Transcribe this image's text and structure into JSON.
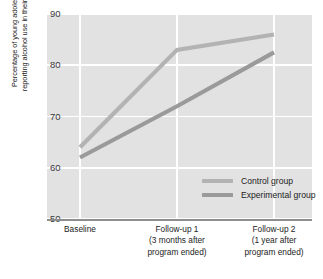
{
  "chart_data": {
    "type": "line",
    "title": "",
    "xlabel": "",
    "ylabel_lines": [
      "Percentage of young adolescents",
      "reporting alcohol use in their lifetime"
    ],
    "categories": [
      "Baseline",
      "Follow-up 1",
      "Follow-up 2"
    ],
    "category_labels": [
      [
        "Baseline"
      ],
      [
        "Follow-up 1",
        "(3 months after",
        "program ended)"
      ],
      [
        "Follow-up 2",
        "(1 year after",
        "program ended)"
      ]
    ],
    "series": [
      {
        "name": "Control group",
        "values": [
          64,
          83,
          86
        ],
        "color": "#b3b3b3"
      },
      {
        "name": "Experimental group",
        "values": [
          62,
          72,
          82.5
        ],
        "color": "#9a9a9a"
      }
    ],
    "ylim": [
      50,
      90
    ],
    "yticks": [
      50,
      60,
      70,
      80,
      90
    ],
    "ytick_labels": [
      "50",
      "60",
      "70",
      "80",
      "90"
    ],
    "grid": true,
    "grid_color": "#ffffff",
    "plot_background": "#e2e2e2",
    "legend_position": "inside-center-right"
  },
  "legend": {
    "entries": [
      {
        "label": "Control group"
      },
      {
        "label": "Experimental group"
      }
    ]
  }
}
